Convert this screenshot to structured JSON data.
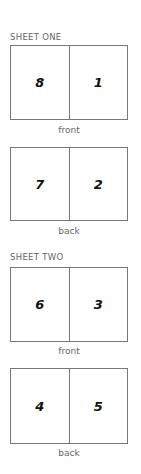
{
  "sheets": [
    {
      "label": "SHEET ONE",
      "sides": [
        {
          "caption": "front",
          "pages": [
            "8",
            "1"
          ]
        },
        {
          "caption": "back",
          "pages": [
            "7",
            "2"
          ]
        }
      ]
    },
    {
      "label": "SHEET TWO",
      "sides": [
        {
          "caption": "front",
          "pages": [
            "6",
            "3"
          ]
        },
        {
          "caption": "back",
          "pages": [
            "4",
            "5"
          ]
        }
      ]
    }
  ]
}
